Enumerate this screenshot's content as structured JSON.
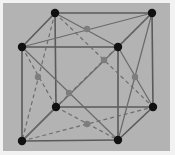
{
  "diagram": {
    "title": "",
    "type": "face-centered cubic lattice unit cell",
    "colors": {
      "background": "#b3b3b3",
      "border": "#f2f2f2",
      "edge": "#5a5a5a",
      "corner_atom": "#111111",
      "face_center_atom": "#7d7d7d"
    },
    "corner_atoms": [
      {
        "id": "top-back-left",
        "x": 55,
        "y": 13
      },
      {
        "id": "top-back-right",
        "x": 152,
        "y": 13
      },
      {
        "id": "top-front-left",
        "x": 22,
        "y": 47
      },
      {
        "id": "top-front-right",
        "x": 118,
        "y": 47
      },
      {
        "id": "bottom-back-left",
        "x": 56,
        "y": 107
      },
      {
        "id": "bottom-back-right",
        "x": 153,
        "y": 107
      },
      {
        "id": "bottom-front-left",
        "x": 22,
        "y": 141
      },
      {
        "id": "bottom-front-right",
        "x": 118,
        "y": 140
      }
    ],
    "face_center_atoms": [
      {
        "id": "top-face",
        "x": 87,
        "y": 29
      },
      {
        "id": "back-face",
        "x": 104,
        "y": 60
      },
      {
        "id": "left-face",
        "x": 38,
        "y": 77
      },
      {
        "id": "front-face",
        "x": 69,
        "y": 93
      },
      {
        "id": "right-face",
        "x": 135,
        "y": 77
      },
      {
        "id": "bottom-face",
        "x": 87,
        "y": 124
      }
    ],
    "labels": []
  }
}
